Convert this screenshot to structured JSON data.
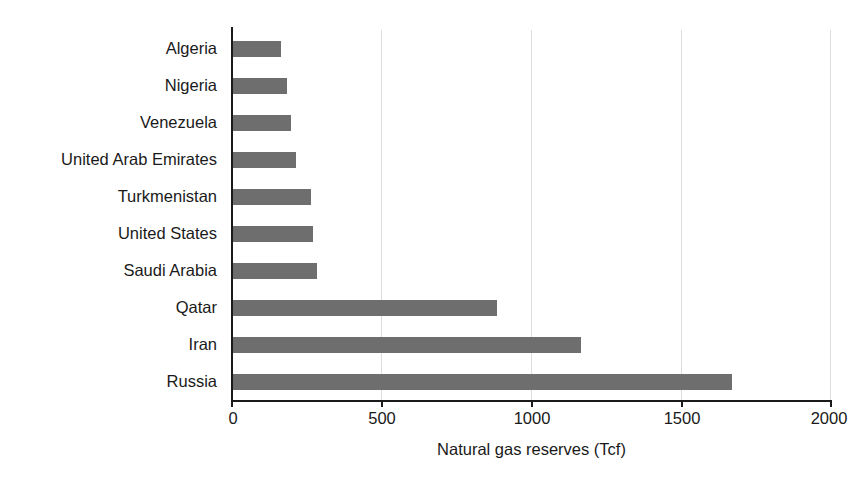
{
  "chart_data": {
    "type": "bar",
    "orientation": "horizontal",
    "title": "",
    "xlabel": "Natural gas reserves (Tcf)",
    "ylabel": "",
    "xlim": [
      0,
      2000
    ],
    "xticks": [
      "0",
      "500",
      "1000",
      "1500",
      "2000"
    ],
    "xtick_values": [
      0,
      500,
      1000,
      1500,
      2000
    ],
    "grid": true,
    "grid_axis": "x",
    "legend": false,
    "bar_color": "#6e6e6e",
    "axis_color": "#1a1a1a",
    "grid_color": "#dddddd",
    "categories": [
      "Algeria",
      "Nigeria",
      "Venezuela",
      "United Arab Emirates",
      "Turkmenistan",
      "United States",
      "Saudi Arabia",
      "Qatar",
      "Iran",
      "Russia"
    ],
    "values": [
      165,
      185,
      200,
      215,
      265,
      272,
      285,
      885,
      1165,
      1670
    ]
  }
}
